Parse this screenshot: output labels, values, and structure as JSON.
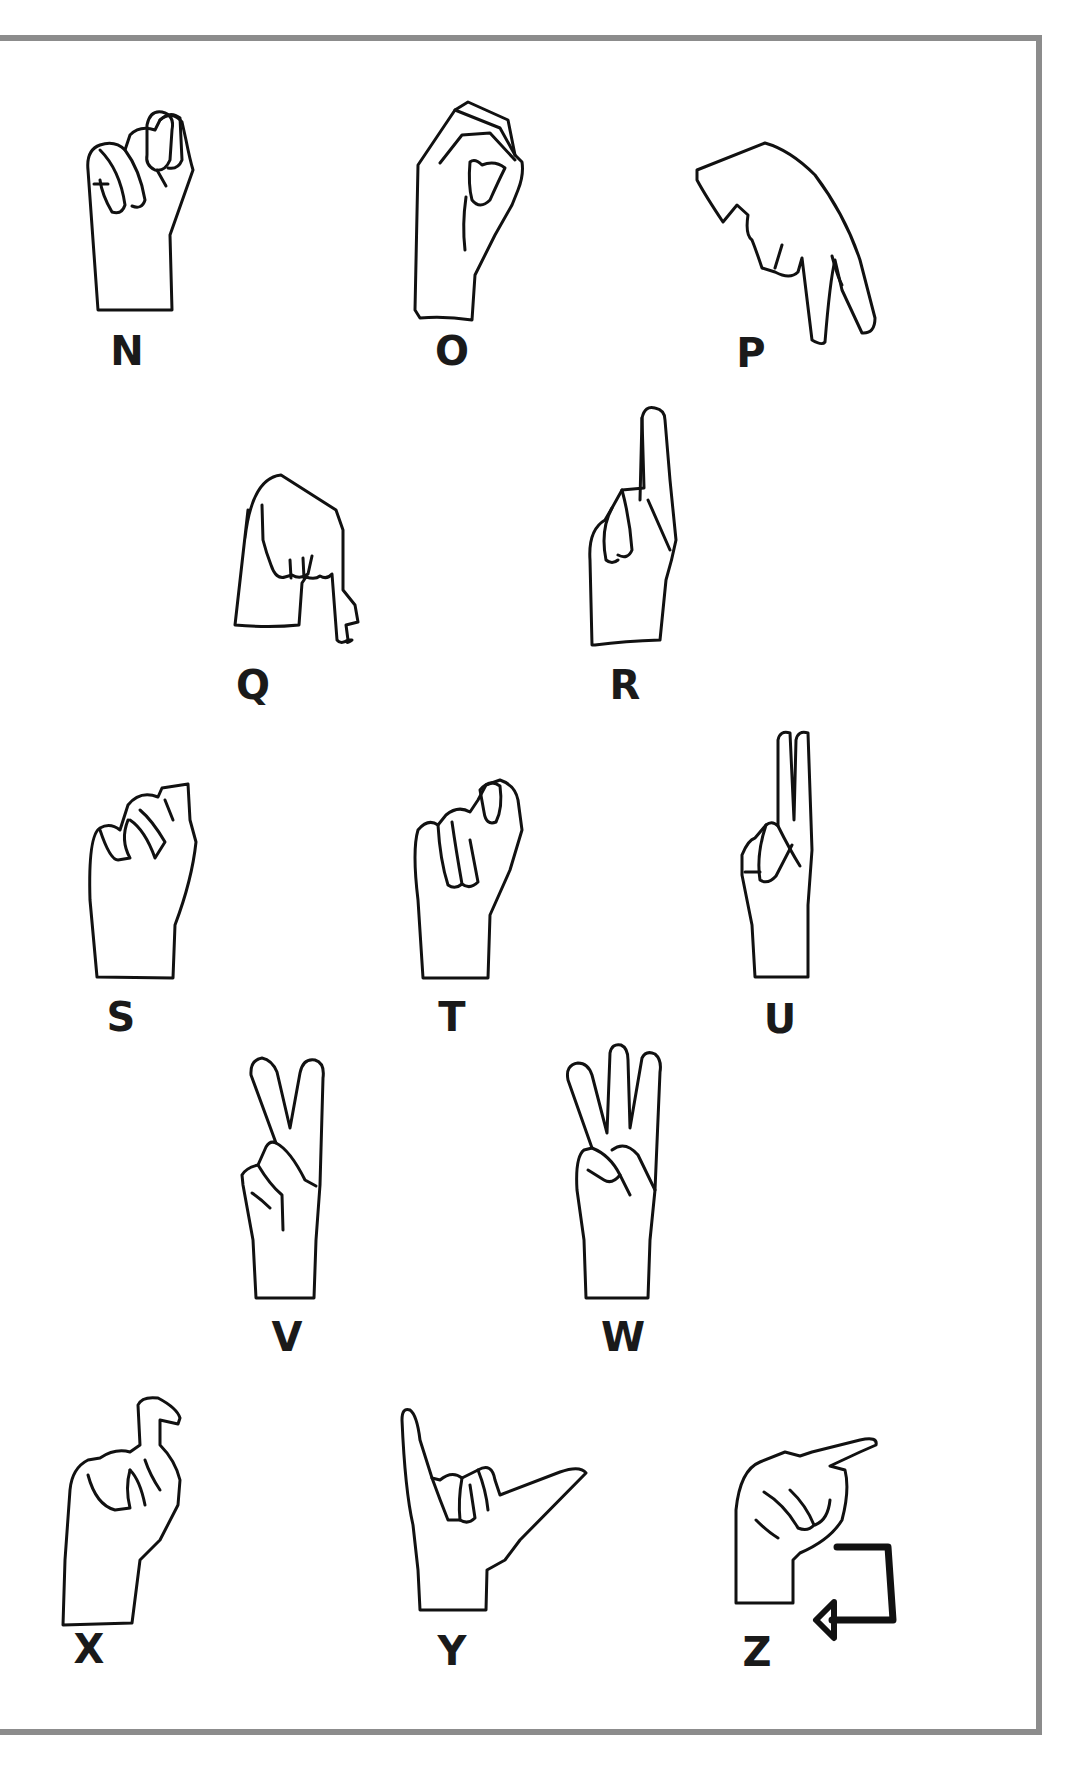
{
  "chart": {
    "title": "",
    "signs": [
      {
        "letter": "N",
        "icon": "asl-n-hand-icon"
      },
      {
        "letter": "O",
        "icon": "asl-o-hand-icon"
      },
      {
        "letter": "P",
        "icon": "asl-p-hand-icon"
      },
      {
        "letter": "Q",
        "icon": "asl-q-hand-icon"
      },
      {
        "letter": "R",
        "icon": "asl-r-hand-icon"
      },
      {
        "letter": "S",
        "icon": "asl-s-hand-icon"
      },
      {
        "letter": "T",
        "icon": "asl-t-hand-icon"
      },
      {
        "letter": "U",
        "icon": "asl-u-hand-icon"
      },
      {
        "letter": "V",
        "icon": "asl-v-hand-icon"
      },
      {
        "letter": "W",
        "icon": "asl-w-hand-icon"
      },
      {
        "letter": "X",
        "icon": "asl-x-hand-icon"
      },
      {
        "letter": "Y",
        "icon": "asl-y-hand-icon"
      },
      {
        "letter": "Z",
        "icon": "asl-z-hand-icon",
        "motion": "z-motion-arrow-icon"
      }
    ]
  },
  "colors": {
    "border": "#8c8c8c",
    "line": "#111111",
    "background": "#ffffff"
  }
}
